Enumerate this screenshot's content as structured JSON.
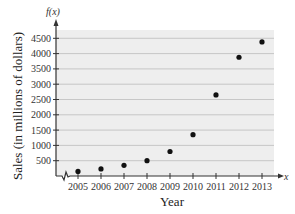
{
  "chart_data": {
    "type": "scatter",
    "title": "",
    "xlabel": "Year",
    "ylabel": "Sales (in millions of dollars)",
    "y_axis_name": "f(x)",
    "x_axis_name": "x",
    "categories": [
      "2005",
      "2006",
      "2007",
      "2008",
      "2009",
      "2010",
      "2011",
      "2012",
      "2013"
    ],
    "x": [
      2005,
      2006,
      2007,
      2008,
      2009,
      2010,
      2011,
      2012,
      2013
    ],
    "values": [
      150,
      230,
      350,
      500,
      800,
      1350,
      2650,
      3880,
      4380
    ],
    "yticks": [
      500,
      1000,
      1500,
      2000,
      2500,
      3000,
      3500,
      4000,
      4500
    ],
    "ylim": [
      0,
      4800
    ],
    "grid": true,
    "x_axis_break": true,
    "legend": null,
    "colors": {
      "plot_bg": "#eeeeee",
      "grid": "#bdbdbd",
      "point": "#111111",
      "axis": "#333333"
    }
  }
}
